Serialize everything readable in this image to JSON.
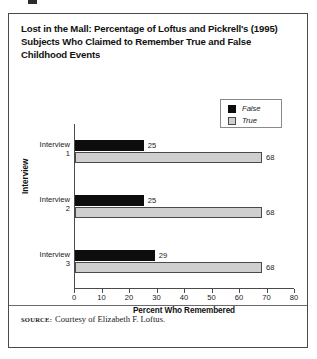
{
  "figure": {
    "title": "Lost in the Mall: Percentage of Loftus and Pickrell's (1995) Subjects Who Claimed to Remember True and False Childhood Events",
    "source_keyword": "SOURCE:",
    "source_text": "Courtesy of Elizabeth F. Loftus."
  },
  "legend": {
    "entries": [
      {
        "label": "False",
        "color": "#0d0d0d"
      },
      {
        "label": "True",
        "color": "#cfcfcf"
      }
    ]
  },
  "chart_data": {
    "type": "bar",
    "orientation": "horizontal",
    "title": "Lost in the Mall: Percentage of Loftus and Pickrell's (1995) Subjects Who Claimed to Remember True and False Childhood Events",
    "categories": [
      "Interview 1",
      "Interview 2",
      "Interview 3"
    ],
    "category_lines": [
      [
        "Interview",
        "1"
      ],
      [
        "Interview",
        "2"
      ],
      [
        "Interview",
        "3"
      ]
    ],
    "series": [
      {
        "name": "False",
        "color": "#0d0d0d",
        "values": [
          25,
          25,
          29
        ]
      },
      {
        "name": "True",
        "color": "#cfcfcf",
        "values": [
          68,
          68,
          68
        ]
      }
    ],
    "xlabel": "Percent Who Remembered",
    "ylabel": "Interview",
    "xlim": [
      0,
      80
    ],
    "xticks": [
      0,
      10,
      20,
      30,
      40,
      50,
      60,
      70,
      80
    ],
    "xtick_labels": [
      "0",
      "10",
      "20",
      "30",
      "40",
      "50",
      "60",
      "70",
      "80"
    ],
    "grid": false,
    "legend_position": "top-right",
    "data_labels": [
      {
        "category": "Interview 1",
        "series": "False",
        "value": 25
      },
      {
        "category": "Interview 1",
        "series": "True",
        "value": 68
      },
      {
        "category": "Interview 2",
        "series": "False",
        "value": 25
      },
      {
        "category": "Interview 2",
        "series": "True",
        "value": 68
      },
      {
        "category": "Interview 3",
        "series": "False",
        "value": 29
      },
      {
        "category": "Interview 3",
        "series": "True",
        "value": 68
      }
    ]
  }
}
